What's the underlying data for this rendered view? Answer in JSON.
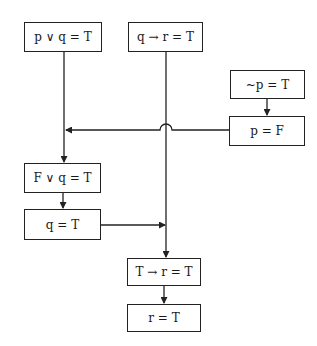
{
  "diagram": {
    "nodes": [
      {
        "id": "p-or-q",
        "label": "p ∨ q = T"
      },
      {
        "id": "q-implies-r",
        "label": "q → r = T"
      },
      {
        "id": "not-p",
        "label": "~p = T"
      },
      {
        "id": "p-false",
        "label": "p = F"
      },
      {
        "id": "f-or-q",
        "label": "F ∨ q = T"
      },
      {
        "id": "q-true",
        "label": "q = T"
      },
      {
        "id": "t-implies-r",
        "label": "T → r = T"
      },
      {
        "id": "r-true",
        "label": "r = T"
      }
    ],
    "edges": [
      {
        "from": "p-or-q",
        "to": "f-or-q"
      },
      {
        "from": "not-p",
        "to": "p-false"
      },
      {
        "from": "p-false",
        "to": "f-or-q",
        "note": "joins left branch; crosses q→r line with a hop"
      },
      {
        "from": "f-or-q",
        "to": "q-true"
      },
      {
        "from": "q-implies-r",
        "to": "t-implies-r"
      },
      {
        "from": "q-true",
        "to": "t-implies-r"
      },
      {
        "from": "t-implies-r",
        "to": "r-true"
      }
    ],
    "colors": {
      "line": "#222222",
      "background": "#ffffff"
    }
  }
}
